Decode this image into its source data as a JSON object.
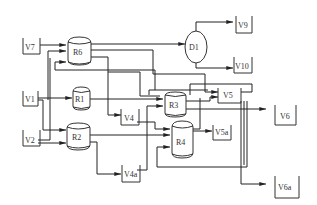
{
  "diagram": {
    "type": "process-flow-diagram",
    "nodes": {
      "V7": {
        "label": "V7",
        "kind": "vessel"
      },
      "V1": {
        "label": "V1",
        "kind": "vessel"
      },
      "V2": {
        "label": "V2",
        "kind": "vessel"
      },
      "R6": {
        "label": "R6",
        "kind": "reactor"
      },
      "R1": {
        "label": "R1",
        "kind": "reactor"
      },
      "R2": {
        "label": "R2",
        "kind": "reactor"
      },
      "R3": {
        "label": "R3",
        "kind": "reactor"
      },
      "R4": {
        "label": "R4",
        "kind": "reactor"
      },
      "D1": {
        "label": "D1",
        "kind": "drum"
      },
      "V4": {
        "label": "V4",
        "kind": "vessel"
      },
      "V4a": {
        "label": "V4a",
        "kind": "vessel"
      },
      "V5": {
        "label": "V5",
        "kind": "vessel"
      },
      "V5a": {
        "label": "V5a",
        "kind": "vessel"
      },
      "V6": {
        "label": "V6",
        "kind": "vessel"
      },
      "V6a": {
        "label": "V6a",
        "kind": "vessel"
      },
      "V9": {
        "label": "V9",
        "kind": "vessel"
      },
      "V10": {
        "label": "V10",
        "kind": "vessel"
      }
    },
    "edges": [
      {
        "from": "V7",
        "to": "R6"
      },
      {
        "from": "V1",
        "to": "R1"
      },
      {
        "from": "V1",
        "to": "R6"
      },
      {
        "from": "V1",
        "to": "R2"
      },
      {
        "from": "V2",
        "to": "R2"
      },
      {
        "from": "V2",
        "to": "R6"
      },
      {
        "from": "R6",
        "to": "D1"
      },
      {
        "from": "R6",
        "to": "V5"
      },
      {
        "from": "R6",
        "to": "V4"
      },
      {
        "from": "D1",
        "to": "V9"
      },
      {
        "from": "D1",
        "to": "V10"
      },
      {
        "from": "R1",
        "to": "R3"
      },
      {
        "from": "R2",
        "to": "R4"
      },
      {
        "from": "R2",
        "to": "V4a"
      },
      {
        "from": "V4",
        "to": "R4"
      },
      {
        "from": "R3",
        "to": "V6"
      },
      {
        "from": "R4",
        "to": "V5a"
      },
      {
        "from": "R4",
        "to": "V5"
      },
      {
        "from": "V5",
        "to": "R3"
      },
      {
        "from": "V5",
        "to": "R4"
      },
      {
        "from": "V5",
        "to": "V6a"
      },
      {
        "from": "V4a",
        "to": "R3"
      }
    ]
  }
}
